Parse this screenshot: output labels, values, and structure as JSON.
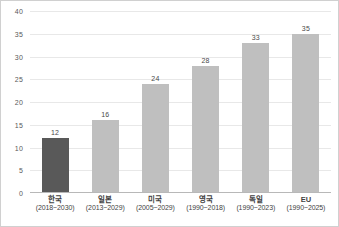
{
  "chart_data": {
    "type": "bar",
    "title": "",
    "subtitle": "",
    "xlabel": "",
    "ylabel": "",
    "ylim": [
      0,
      40
    ],
    "ytick_step": 5,
    "grid": true,
    "legend": false,
    "categories": [
      "한국",
      "일본",
      "미국",
      "영국",
      "독일",
      "EU"
    ],
    "periods": [
      "(2018~2030)",
      "(2013~2029)",
      "(2005~2029)",
      "(1990~2018)",
      "(1990~2023)",
      "(1990~2025)"
    ],
    "values": [
      12,
      16,
      24,
      28,
      33,
      35
    ],
    "value_labels": [
      "12",
      "16",
      "24",
      "28",
      "33",
      "35"
    ],
    "ytick_labels": [
      "0",
      "5",
      "10",
      "15",
      "20",
      "25",
      "30",
      "35",
      "40"
    ],
    "ytick_values": [
      0,
      5,
      10,
      15,
      20,
      25,
      30,
      35,
      40
    ],
    "bar_colors": [
      "#595959",
      "#bfbfbf",
      "#bfbfbf",
      "#bfbfbf",
      "#bfbfbf",
      "#bfbfbf"
    ],
    "highlight_index": 0,
    "colors": {
      "highlight_bar": "#595959",
      "default_bar": "#bfbfbf",
      "gridline": "#e8e8e8",
      "axis": "#b8b8b8",
      "border": "#d0d0d0",
      "text": "#3f3f3f",
      "background": "#ffffff"
    }
  }
}
